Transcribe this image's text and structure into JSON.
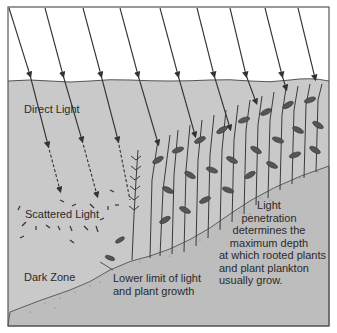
{
  "diagram": {
    "colors": {
      "air": "#ffffff",
      "water": "#c9c9c9",
      "ground": "#bdbdbd",
      "frame": "#555555",
      "ray": "#333333",
      "plant": "#3a3a3a",
      "text": "#2a2a2a"
    },
    "labels": {
      "direct_light": "Direct Light",
      "scattered_light": "Scattered Light",
      "dark_zone": "Dark Zone",
      "lower_limit_line1": "Lower limit of light",
      "lower_limit_line2": "and plant growth",
      "penetration_line1": "Light",
      "penetration_line2": "penetration",
      "penetration_line3": "determines the",
      "penetration_line4": "maximum depth",
      "penetration_line5": "at which rooted plants",
      "penetration_line6": "and plant plankton",
      "penetration_line7": "usually grow."
    },
    "zones": [
      "Direct Light",
      "Scattered Light",
      "Dark Zone"
    ],
    "ray_count": 9
  }
}
